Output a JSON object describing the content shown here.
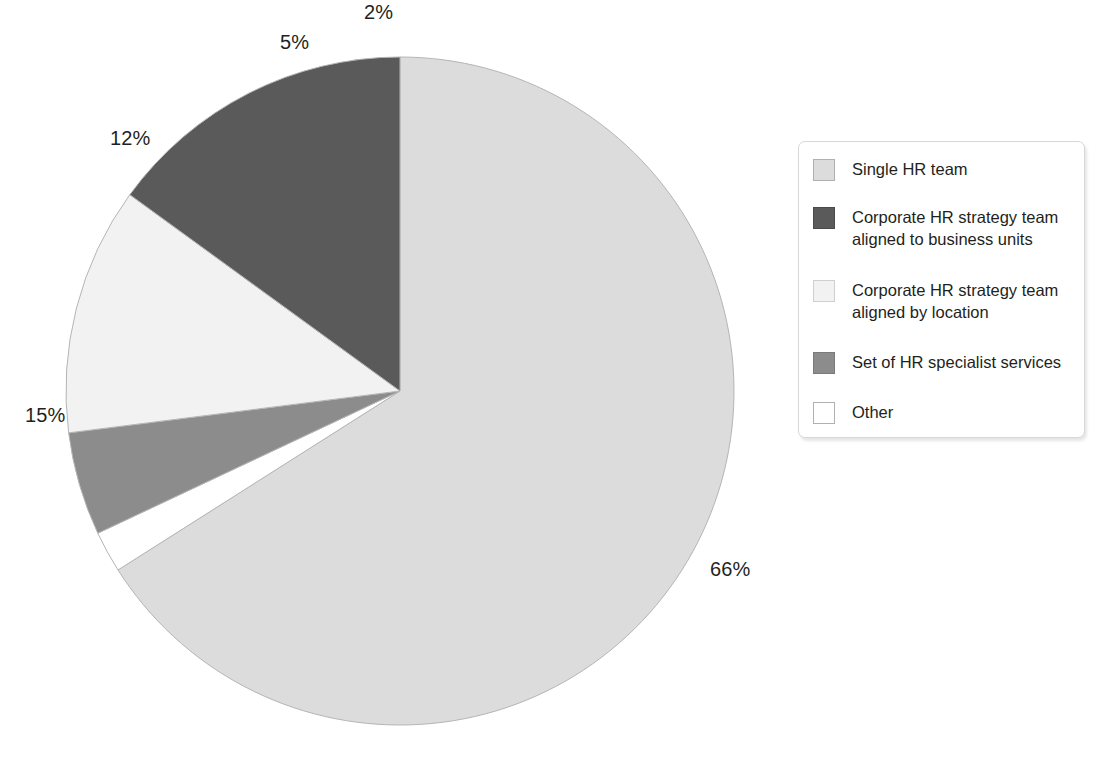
{
  "chart_data": {
    "type": "pie",
    "title": "",
    "subtitle": "",
    "xlabel": "",
    "ylabel": "",
    "legend_position": "right",
    "start_angle_deg": 0,
    "direction": "clockwise",
    "categories": [
      "Single HR team",
      "Corporate HR strategy team aligned to business units",
      "Corporate HR strategy team aligned by location",
      "Set of HR specialist services",
      "Other"
    ],
    "values": [
      66,
      15,
      12,
      5,
      2
    ],
    "value_labels": [
      "66%",
      "15%",
      "12%",
      "5%",
      "2%"
    ],
    "colors": [
      "#dcdcdc",
      "#5a5a5a",
      "#f2f2f2",
      "#8c8c8c",
      "#ffffff"
    ],
    "slice_border_color": "#b5b5b5",
    "units": "%"
  },
  "pie": {
    "center_x": 400,
    "center_y": 391,
    "radius": 334,
    "slices": [
      {
        "name": "single-hr-team",
        "label": "66%",
        "value": 66,
        "color": "#dcdcdc",
        "label_x": 710,
        "label_y": 558
      },
      {
        "name": "corporate-hr-business",
        "label": "15%",
        "value": 15,
        "color": "#5a5a5a",
        "label_x": 25,
        "label_y": 404
      },
      {
        "name": "corporate-hr-location",
        "label": "12%",
        "value": 12,
        "color": "#f2f2f2",
        "label_x": 110,
        "label_y": 127
      },
      {
        "name": "set-hr-specialist",
        "label": "5%",
        "value": 5,
        "color": "#8c8c8c",
        "label_x": 280,
        "label_y": 31
      },
      {
        "name": "other",
        "label": "2%",
        "value": 2,
        "color": "#ffffff",
        "label_x": 364,
        "label_y": 1
      }
    ]
  },
  "legend": {
    "items": [
      {
        "label": "Single HR team",
        "color": "#dcdcdc",
        "border": "#b0b0b0",
        "top": 16,
        "name": "single-hr-team"
      },
      {
        "label": "Corporate HR strategy team\naligned to business units",
        "color": "#5a5a5a",
        "border": "#4a4a4a",
        "top": 64,
        "name": "corporate-hr-business-units"
      },
      {
        "label": "Corporate HR strategy team\naligned by location",
        "color": "#f2f2f2",
        "border": "#cfcfcf",
        "top": 137,
        "name": "corporate-hr-location"
      },
      {
        "label": "Set of HR specialist services",
        "color": "#8c8c8c",
        "border": "#7a7a7a",
        "top": 209,
        "name": "set-hr-specialist-services"
      },
      {
        "label": "Other",
        "color": "#ffffff",
        "border": "#b0b0b0",
        "top": 259,
        "name": "other"
      }
    ]
  }
}
